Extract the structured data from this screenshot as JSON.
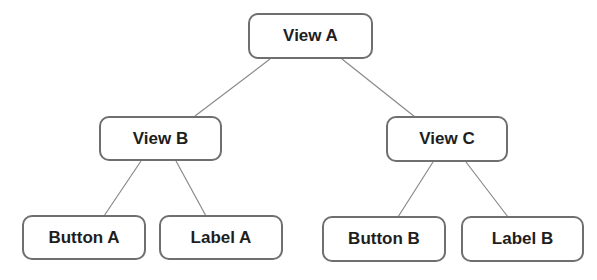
{
  "diagram": {
    "type": "tree",
    "nodes": {
      "view_a": {
        "label": "View A"
      },
      "view_b": {
        "label": "View B"
      },
      "view_c": {
        "label": "View C"
      },
      "button_a": {
        "label": "Button A"
      },
      "label_a": {
        "label": "Label A"
      },
      "button_b": {
        "label": "Button B"
      },
      "label_b": {
        "label": "Label B"
      }
    },
    "edges": [
      {
        "from": "View A",
        "to": "View B"
      },
      {
        "from": "View A",
        "to": "View C"
      },
      {
        "from": "View B",
        "to": "Button A"
      },
      {
        "from": "View B",
        "to": "Label A"
      },
      {
        "from": "View C",
        "to": "Button B"
      },
      {
        "from": "View C",
        "to": "Label B"
      }
    ]
  }
}
